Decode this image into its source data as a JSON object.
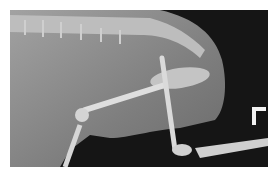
{
  "image": {
    "description": "Lateral abdominal radiograph of a small animal showing spine, pelvis and hind limbs",
    "marker_label": "L",
    "colors": {
      "background": "#ffffff",
      "film_dark": "#151515",
      "soft_tissue": "#8a8a8a",
      "bone": "#d8d8d8",
      "marker": "#f2f2f2"
    }
  }
}
